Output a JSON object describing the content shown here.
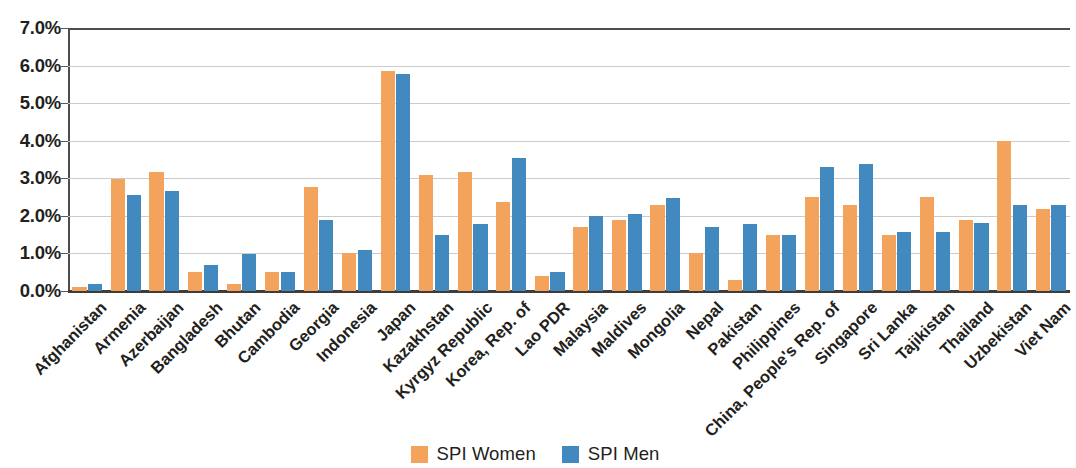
{
  "chart_data": {
    "type": "bar",
    "title": "",
    "subtitle": "",
    "xlabel": "",
    "ylabel": "",
    "ylim": [
      0,
      7.0
    ],
    "y_tick_values": [
      7.0,
      6.0,
      5.0,
      4.0,
      3.0,
      2.0,
      1.0,
      0.0
    ],
    "y_tick_labels": [
      "7.0%",
      "6.0%",
      "5.0%",
      "4.0%",
      "3.0%",
      "2.0%",
      "1.0%",
      "0.0%"
    ],
    "value_suffix": "%",
    "grid": true,
    "grid_axis": "y",
    "legend_position": "bottom-center",
    "orientation": "vertical",
    "categories": [
      "Afghanistan",
      "Armenia",
      "Azerbaijan",
      "Bangladesh",
      "Bhutan",
      "Cambodia",
      "Georgia",
      "Indonesia",
      "Japan",
      "Kazakhstan",
      "Kyrgyz Republic",
      "Korea, Rep. of",
      "Lao PDR",
      "Malaysia",
      "Maldives",
      "Mongolia",
      "Nepal",
      "Pakistan",
      "Philippines",
      "China, People's Rep. of",
      "Singapore",
      "Sri Lanka",
      "Tajikistan",
      "Thailand",
      "Uzbekistan",
      "Viet Nam"
    ],
    "series": [
      {
        "name": "SPI Women",
        "color": "#f3a35c",
        "values": [
          0.1,
          2.97,
          3.17,
          0.5,
          0.2,
          0.5,
          2.78,
          1.0,
          5.85,
          3.08,
          3.18,
          2.38,
          0.4,
          1.7,
          1.9,
          2.28,
          1.0,
          0.3,
          1.5,
          2.5,
          2.3,
          1.5,
          2.5,
          1.88,
          4.0,
          2.18
        ]
      },
      {
        "name": "SPI Men",
        "color": "#4189be",
        "values": [
          0.18,
          2.55,
          2.65,
          0.68,
          0.98,
          0.5,
          1.88,
          1.1,
          5.78,
          1.48,
          1.78,
          3.55,
          0.5,
          2.0,
          2.05,
          2.48,
          1.7,
          1.78,
          1.5,
          3.3,
          3.38,
          1.58,
          1.58,
          1.8,
          2.28,
          2.3
        ]
      }
    ],
    "legend": [
      {
        "label": "SPI Women",
        "color": "#f3a35c",
        "swatch": "women"
      },
      {
        "label": "SPI Men",
        "color": "#4189be",
        "swatch": "men"
      }
    ],
    "colors": {
      "women": "#f3a35c",
      "men": "#4189be",
      "gridline": "#c9cbcd",
      "axis": "#3f3c3a",
      "text": "#231f20",
      "background": "#ffffff"
    }
  }
}
